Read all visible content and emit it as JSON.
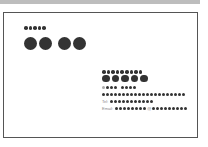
{
  "card": {
    "title_masked": "●●●●●",
    "name_masked": [
      "●●",
      "●●"
    ],
    "company_masked": "●●●●●●●●●",
    "company_sub_masked": "●●●●●",
    "address_short_masked": "●●●-●●●●",
    "address_masked": "●●●●●●●●●●●●●●●●●●●●●●●●",
    "tel_label": "Tel:",
    "tel_masked": "●●●●●●●●●●●●",
    "email_label": "Email:",
    "email_user_masked": "●●●●●●●●",
    "email_at": "@",
    "email_domain_masked": "●●●●●●●●●●"
  },
  "colors": {
    "ink": "#333333",
    "border": "#555555",
    "topband": "#bdbdbd"
  }
}
